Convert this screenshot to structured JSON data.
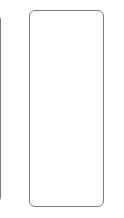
{
  "carousel": {
    "cards": [
      {
        "id": "card-previous",
        "label": "",
        "visible": "partial"
      },
      {
        "id": "card-current",
        "label": "",
        "visible": "full"
      }
    ]
  },
  "colors": {
    "background": "#ffffff",
    "card_border": "#7a7a7a",
    "card_fill": "#ffffff"
  }
}
